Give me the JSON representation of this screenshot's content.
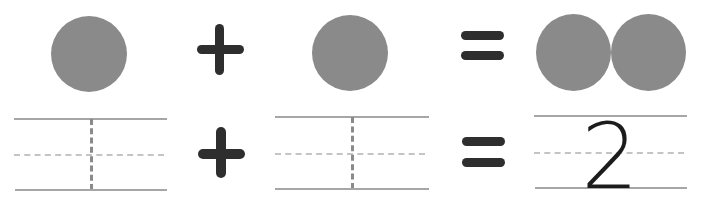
{
  "colors": {
    "circle": "#8a8a8a",
    "symbol": "#2e2e2e",
    "line": "#a6a6a6",
    "dash": "#bdbdbd",
    "vdash": "#8a8a8a",
    "digit": "#1c1c1c"
  },
  "row1": {
    "left_count": 1,
    "operator": "+",
    "right_count": 1,
    "equals": "=",
    "result_count": 2
  },
  "row2": {
    "box1_answer": "",
    "operator": "+",
    "box2_answer": "",
    "equals": "=",
    "result_answer": "2"
  }
}
